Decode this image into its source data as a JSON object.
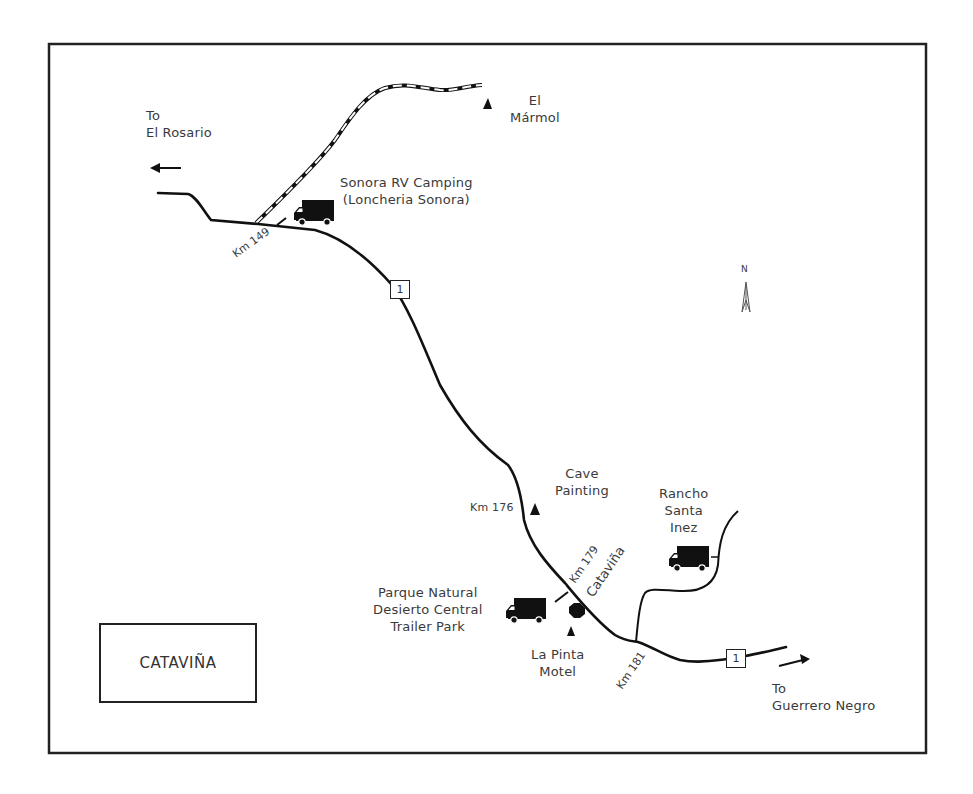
{
  "map": {
    "title": "CATAVIÑA",
    "north_label": "N",
    "highway_number": "1",
    "directions": {
      "west": {
        "line1": "To",
        "line2": "El Rosario"
      },
      "east": {
        "line1": "To",
        "line2": "Guerrero Negro"
      }
    },
    "km_markers": [
      {
        "label": "Km 149"
      },
      {
        "label": "Km 176"
      },
      {
        "label": "Km 179"
      },
      {
        "label": "Km 181"
      }
    ],
    "places": {
      "el_marmol": {
        "line1": "El",
        "line2": "Mármol"
      },
      "sonora_rv": {
        "line1": "Sonora RV Camping",
        "line2": "(Loncheria Sonora)"
      },
      "cave_painting": {
        "line1": "Cave",
        "line2": "Painting"
      },
      "rancho_santa_inez": {
        "line1": "Rancho",
        "line2": "Santa",
        "line3": "Inez"
      },
      "parque_natural": {
        "line1": "Parque Natural",
        "line2": "Desierto Central",
        "line3": "Trailer Park"
      },
      "la_pinta": {
        "line1": "La Pinta",
        "line2": "Motel"
      },
      "town": {
        "label": "Cataviña"
      }
    },
    "colors": {
      "line": "#1a1a1a",
      "text": "#3a3a3a",
      "background": "#ffffff"
    }
  }
}
